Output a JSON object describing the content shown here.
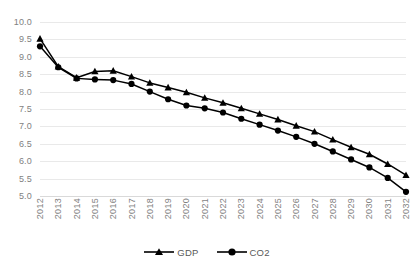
{
  "chart_data": {
    "type": "line",
    "title": "",
    "subtitle": "",
    "xlabel": "",
    "ylabel": "",
    "grid": true,
    "legend_position": "bottom",
    "ylim": [
      5.0,
      10.0
    ],
    "ytick_labels": [
      "10.0",
      "9.5",
      "9.0",
      "8.5",
      "8.0",
      "7.5",
      "7.0",
      "6.5",
      "6.0",
      "5.5",
      "5.0"
    ],
    "ytick_values": [
      10.0,
      9.5,
      9.0,
      8.5,
      8.0,
      7.5,
      7.0,
      6.5,
      6.0,
      5.5,
      5.0
    ],
    "categories": [
      "2012",
      "2013",
      "2014",
      "2015",
      "2016",
      "2017",
      "2018",
      "2019",
      "2020",
      "2021",
      "2022",
      "2023",
      "2024",
      "2025",
      "2026",
      "2027",
      "2028",
      "2029",
      "2030",
      "2031",
      "2032"
    ],
    "x": [
      2012,
      2013,
      2014,
      2015,
      2016,
      2017,
      2018,
      2019,
      2020,
      2021,
      2022,
      2023,
      2024,
      2025,
      2026,
      2027,
      2028,
      2029,
      2030,
      2031,
      2032
    ],
    "series": [
      {
        "name": "GDP",
        "marker": "triangle",
        "color": "#000000",
        "values": [
          9.52,
          8.72,
          8.4,
          8.58,
          8.6,
          8.43,
          8.25,
          8.12,
          7.98,
          7.82,
          7.68,
          7.52,
          7.36,
          7.2,
          7.02,
          6.85,
          6.62,
          6.4,
          6.2,
          5.92,
          5.6
        ]
      },
      {
        "name": "CO2",
        "marker": "circle",
        "color": "#000000",
        "values": [
          9.3,
          8.7,
          8.38,
          8.35,
          8.33,
          8.22,
          8.0,
          7.78,
          7.6,
          7.52,
          7.4,
          7.22,
          7.05,
          6.88,
          6.7,
          6.5,
          6.28,
          6.05,
          5.82,
          5.52,
          5.12
        ]
      }
    ]
  },
  "legend": {
    "items": [
      {
        "label": "GDP",
        "marker": "triangle"
      },
      {
        "label": "CO2",
        "marker": "circle"
      }
    ]
  }
}
